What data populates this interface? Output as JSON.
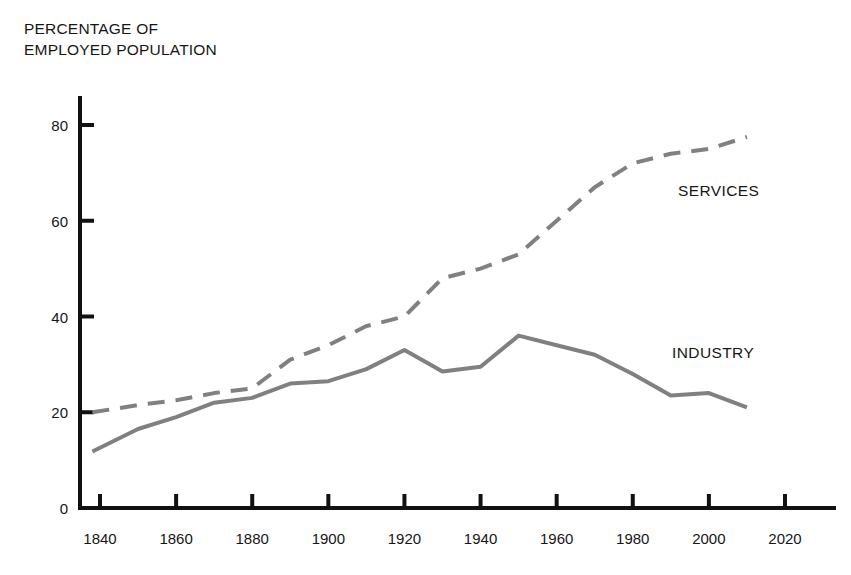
{
  "figure": {
    "background_color": "#ffffff",
    "axis_color": "#111111",
    "y_axis_title_line1": "PERCENTAGE OF",
    "y_axis_title_line2": "EMPLOYED POPULATION",
    "y_axis_title": "PERCENTAGE OF\nEMPLOYED POPULATION",
    "partial_top_text": " "
  },
  "chart_data": {
    "type": "line",
    "title": "",
    "subtitle": "",
    "xlabel": "",
    "ylabel": "PERCENTAGE OF EMPLOYED POPULATION",
    "xlim": [
      1830,
      2030
    ],
    "ylim": [
      0,
      88
    ],
    "xticks": [
      1840,
      1860,
      1880,
      1900,
      1920,
      1940,
      1960,
      1980,
      2000,
      2020
    ],
    "yticks": [
      0,
      20,
      40,
      60,
      80
    ],
    "xtick_labels": [
      "1840",
      "1860",
      "1880",
      "1900",
      "1920",
      "1940",
      "1960",
      "1980",
      "2000",
      "2020"
    ],
    "ytick_labels": [
      "0",
      "20",
      "40",
      "60",
      "80"
    ],
    "grid": false,
    "legend_position": "inline-annotation",
    "tick_direction": "in",
    "series": [
      {
        "name": "SERVICES",
        "label": "SERVICES",
        "color": "#808080",
        "linestyle": "dashed",
        "linewidth": 4,
        "x": [
          1838,
          1850,
          1860,
          1870,
          1880,
          1890,
          1900,
          1910,
          1920,
          1930,
          1940,
          1950,
          1960,
          1970,
          1980,
          1990,
          2000,
          2010
        ],
        "values": [
          20,
          21.5,
          22.5,
          24,
          25,
          31,
          34,
          38,
          40,
          48,
          50,
          53,
          60,
          67,
          72,
          74,
          75,
          77.5
        ]
      },
      {
        "name": "INDUSTRY",
        "label": "INDUSTRY",
        "color": "#808080",
        "linestyle": "solid",
        "linewidth": 4,
        "x": [
          1838,
          1850,
          1860,
          1870,
          1880,
          1890,
          1900,
          1910,
          1920,
          1930,
          1940,
          1950,
          1960,
          1970,
          1980,
          1990,
          2000,
          2010
        ],
        "values": [
          11.8,
          16.5,
          19,
          22,
          23,
          26,
          26.5,
          29,
          33,
          28.5,
          29.5,
          36,
          34,
          32,
          28,
          23.5,
          24,
          21
        ]
      }
    ]
  }
}
